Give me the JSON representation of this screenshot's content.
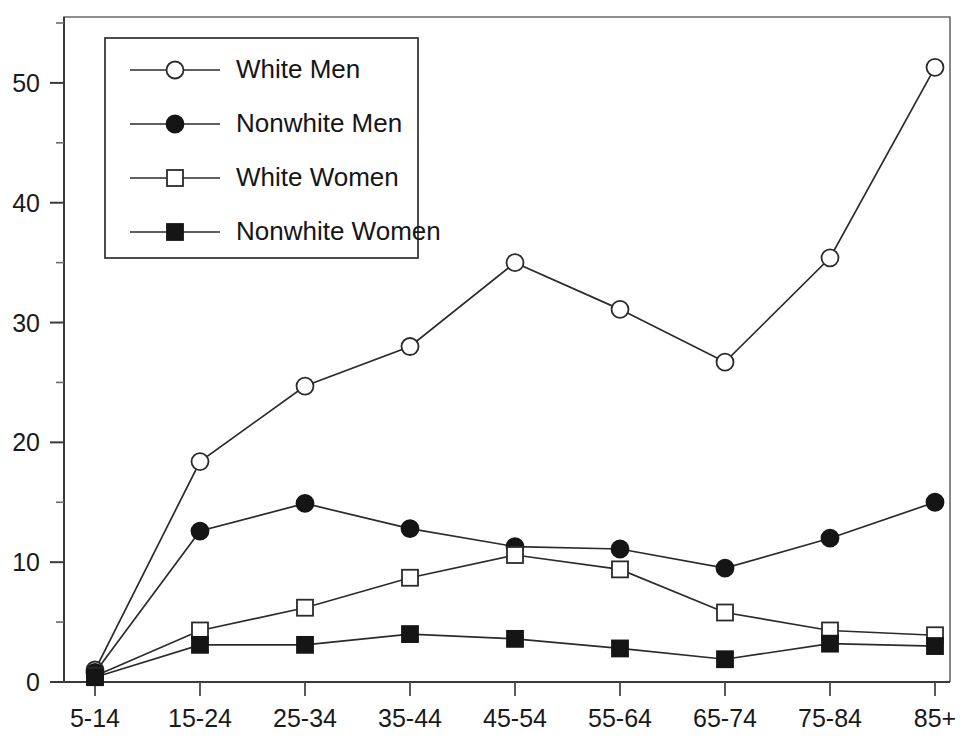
{
  "chart_data": {
    "type": "line",
    "title": "",
    "subtitle": "",
    "xlabel": "",
    "ylabel": "",
    "categories": [
      "5-14",
      "15-24",
      "25-34",
      "35-44",
      "45-54",
      "55-64",
      "65-74",
      "75-84",
      "85+"
    ],
    "ylim": [
      0,
      55.5
    ],
    "yticks": [
      0,
      10,
      20,
      30,
      40,
      50
    ],
    "ytick_labels": [
      "0",
      "10",
      "20",
      "30",
      "40",
      "50"
    ],
    "yticks_minor": [
      5,
      15,
      25,
      35,
      45,
      55
    ],
    "grid": false,
    "legend_position": "upper-left",
    "series": [
      {
        "name": "White Men",
        "marker": "open-circle",
        "color": "#2b2b2b",
        "values": [
          1.0,
          18.4,
          24.7,
          28.0,
          35.0,
          31.1,
          26.7,
          35.4,
          51.3
        ]
      },
      {
        "name": "Nonwhite Men",
        "marker": "filled-circle",
        "color": "#151515",
        "values": [
          0.8,
          12.6,
          14.9,
          12.8,
          11.3,
          11.1,
          9.5,
          12.0,
          15.0
        ]
      },
      {
        "name": "White Women",
        "marker": "open-square",
        "color": "#2b2b2b",
        "values": [
          0.5,
          4.3,
          6.2,
          8.7,
          10.6,
          9.4,
          5.8,
          4.3,
          3.9
        ]
      },
      {
        "name": "Nonwhite Women",
        "marker": "filled-square",
        "color": "#151515",
        "values": [
          0.4,
          3.1,
          3.1,
          4.0,
          3.6,
          2.8,
          1.9,
          3.2,
          3.0
        ]
      }
    ]
  },
  "legend": {
    "entries": [
      {
        "label": "White Men",
        "marker": "open-circle"
      },
      {
        "label": "Nonwhite Men",
        "marker": "filled-circle"
      },
      {
        "label": "White Women",
        "marker": "open-square"
      },
      {
        "label": "Nonwhite Women",
        "marker": "filled-square"
      }
    ]
  },
  "colors": {
    "background": "#ffffff",
    "axis": "#3a3a3a",
    "frame": "#6a6a6a",
    "line": "#2b2b2b",
    "marker_fill_dark": "#151515",
    "marker_fill_light": "#ffffff",
    "text": "#1a1a1a"
  }
}
